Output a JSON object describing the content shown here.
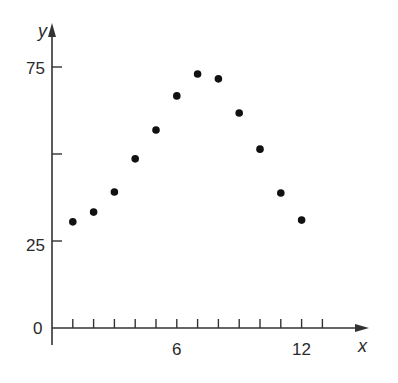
{
  "chart_data": {
    "type": "scatter",
    "title": "",
    "xlabel": "x",
    "ylabel": "y",
    "xlim": [
      0,
      14
    ],
    "ylim": [
      0,
      80
    ],
    "grid": false,
    "legend": null,
    "x_ticks": [
      1,
      2,
      3,
      4,
      5,
      6,
      7,
      8,
      9,
      10,
      11,
      12,
      13
    ],
    "x_tick_labels": [
      {
        "value": 6,
        "label": "6"
      },
      {
        "value": 12,
        "label": "12"
      }
    ],
    "y_ticks": [
      25,
      50,
      75
    ],
    "y_tick_labels": [
      {
        "value": 0,
        "label": "0"
      },
      {
        "value": 25,
        "label": "25"
      },
      {
        "value": 75,
        "label": "75"
      }
    ],
    "x": [
      1,
      2,
      3,
      4,
      5,
      6,
      7,
      8,
      9,
      10,
      11,
      12
    ],
    "y": [
      30.5,
      33.3,
      39.1,
      48.6,
      56.9,
      66.7,
      73.0,
      71.6,
      61.8,
      51.4,
      38.8,
      31.0
    ],
    "point_color": "#111111",
    "axis_color": "#333333"
  },
  "labels": {
    "x_axis": "x",
    "y_axis": "y",
    "origin": "0",
    "y25": "25",
    "y75": "75",
    "x6": "6",
    "x12": "12"
  }
}
